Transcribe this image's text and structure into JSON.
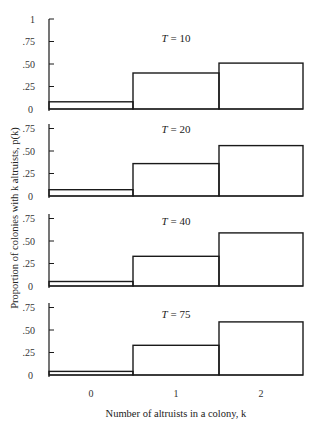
{
  "chart_data": {
    "type": "bar",
    "title": "",
    "xlabel": "Number of altruists in a colony, k",
    "ylabel": "Proportion of colonies with k altruists, p(k)",
    "categories": [
      "0",
      "1",
      "2"
    ],
    "ylim": [
      0,
      1
    ],
    "yticks": [
      "0",
      ".25",
      ".50",
      ".75",
      "1"
    ],
    "grid": false,
    "legend": null,
    "panels": [
      {
        "label": "T = 10",
        "values": [
          0.08,
          0.4,
          0.51
        ]
      },
      {
        "label": "T = 20",
        "values": [
          0.07,
          0.36,
          0.56
        ]
      },
      {
        "label": "T = 40",
        "values": [
          0.05,
          0.33,
          0.59
        ]
      },
      {
        "label": "T = 75",
        "values": [
          0.04,
          0.33,
          0.59
        ]
      }
    ]
  },
  "panel_titles": [
    "T = 10",
    "T = 20",
    "T = 40",
    "T = 75"
  ],
  "x_axis": {
    "label": "Number of altruists in a colony, k",
    "ticks": [
      "0",
      "1",
      "2"
    ]
  },
  "y_axis": {
    "label": "Proportion of colonies with k altruists, p(k)",
    "first_panel_top_tick": "1"
  },
  "colors": {
    "line": "#1a1a1a",
    "background": "#ffffff"
  }
}
